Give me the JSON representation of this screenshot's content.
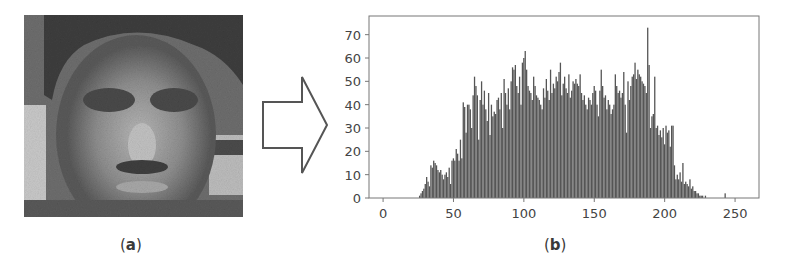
{
  "figure": {
    "panel_a": {
      "caption_open": "(",
      "caption_letter": "a",
      "caption_close": ")",
      "description": "grayscale face image"
    },
    "arrow": {
      "direction": "right",
      "stroke": "#555555"
    },
    "panel_b": {
      "caption_open": "(",
      "caption_letter": "b",
      "caption_close": ")"
    }
  },
  "chart_data": {
    "type": "bar",
    "title": "",
    "xlabel": "",
    "ylabel": "",
    "xlim": [
      -10,
      267
    ],
    "ylim": [
      0,
      78
    ],
    "xticks": [
      0,
      50,
      100,
      150,
      200,
      250
    ],
    "yticks": [
      0,
      10,
      20,
      30,
      40,
      50,
      60,
      70
    ],
    "grid": false,
    "legend": null,
    "bar_color": "#555555",
    "x_start": 0,
    "values": [
      0,
      0,
      0,
      0,
      0,
      0,
      0,
      0,
      0,
      0,
      0,
      0,
      0,
      0,
      0,
      0,
      0,
      0,
      0,
      0,
      0,
      0,
      0,
      0,
      0,
      0,
      1,
      2,
      3,
      4,
      6,
      9,
      7,
      5,
      14,
      13,
      16,
      15,
      14,
      12,
      11,
      12,
      10,
      8,
      10,
      11,
      9,
      13,
      6,
      16,
      17,
      16,
      21,
      19,
      16,
      25,
      17,
      41,
      39,
      28,
      40,
      40,
      38,
      30,
      44,
      52,
      48,
      44,
      25,
      42,
      50,
      40,
      46,
      38,
      33,
      45,
      27,
      40,
      35,
      37,
      36,
      42,
      43,
      38,
      45,
      30,
      51,
      45,
      40,
      47,
      38,
      50,
      56,
      55,
      57,
      48,
      45,
      52,
      40,
      58,
      60,
      63,
      55,
      48,
      46,
      45,
      42,
      52,
      48,
      44,
      43,
      42,
      40,
      38,
      47,
      43,
      51,
      46,
      42,
      55,
      45,
      49,
      47,
      52,
      50,
      54,
      58,
      44,
      49,
      52,
      47,
      45,
      53,
      43,
      46,
      50,
      49,
      51,
      49,
      48,
      53,
      45,
      42,
      44,
      40,
      38,
      43,
      42,
      40,
      45,
      48,
      46,
      40,
      35,
      46,
      55,
      48,
      43,
      44,
      38,
      42,
      40,
      36,
      38,
      40,
      53,
      48,
      45,
      46,
      43,
      45,
      54,
      40,
      28,
      50,
      42,
      48,
      52,
      53,
      58,
      51,
      55,
      53,
      52,
      50,
      49,
      48,
      45,
      73,
      57,
      30,
      35,
      36,
      52,
      30,
      31,
      27,
      29,
      26,
      30,
      23,
      31,
      28,
      29,
      22,
      31,
      31,
      14,
      8,
      10,
      8,
      11,
      7,
      15,
      6,
      7,
      6,
      5,
      8,
      4,
      5,
      3,
      3,
      2,
      2,
      1,
      1,
      1,
      0,
      1,
      0,
      0,
      0,
      0,
      0,
      0,
      0,
      0,
      0,
      0,
      0,
      0,
      0,
      2,
      0,
      0,
      0
    ]
  }
}
